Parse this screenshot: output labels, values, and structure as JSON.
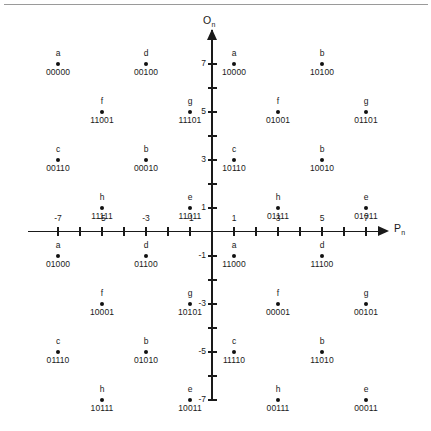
{
  "figure": {
    "x_axis_label": "P",
    "x_axis_sub": "n",
    "y_axis_label": "O",
    "y_axis_sub": "n",
    "point_color": "#111111",
    "axis_color": "#1a1a1a",
    "rule_color": "#9a9a9a"
  },
  "chart_data": {
    "type": "scatter",
    "title": "",
    "xlabel": "Pn",
    "ylabel": "On",
    "xlim": [
      -8.5,
      8.5
    ],
    "ylim": [
      -8.5,
      8.5
    ],
    "grid": false,
    "legend": "none",
    "x_ticks": [
      -7,
      -6,
      -5,
      -4,
      -3,
      -2,
      -1,
      1,
      2,
      3,
      4,
      5,
      6,
      7
    ],
    "x_tick_labels": [
      "-7",
      "",
      "-5",
      "",
      "-3",
      "",
      "-1",
      "1",
      "",
      "3",
      "",
      "5",
      "",
      "7"
    ],
    "y_ticks": [
      7,
      6,
      5,
      4,
      3,
      2,
      1,
      -1,
      -2,
      -3,
      -4,
      -5,
      -6,
      -7
    ],
    "y_tick_labels": [
      "7",
      "",
      "5",
      "",
      "3",
      "",
      "1",
      "-1",
      "",
      "-3",
      "",
      "-5",
      "",
      "-7"
    ],
    "points": [
      {
        "x": -7,
        "y": 7,
        "letter": "a",
        "code": "00000"
      },
      {
        "x": -3,
        "y": 7,
        "letter": "d",
        "code": "00100"
      },
      {
        "x": 1,
        "y": 7,
        "letter": "a",
        "code": "10000"
      },
      {
        "x": 5,
        "y": 7,
        "letter": "b",
        "code": "10100"
      },
      {
        "x": -5,
        "y": 5,
        "letter": "f",
        "code": "11001"
      },
      {
        "x": -1,
        "y": 5,
        "letter": "g",
        "code": "11101"
      },
      {
        "x": 3,
        "y": 5,
        "letter": "f",
        "code": "01001"
      },
      {
        "x": 7,
        "y": 5,
        "letter": "g",
        "code": "01101"
      },
      {
        "x": -7,
        "y": 3,
        "letter": "c",
        "code": "00110"
      },
      {
        "x": -3,
        "y": 3,
        "letter": "b",
        "code": "00010"
      },
      {
        "x": 1,
        "y": 3,
        "letter": "c",
        "code": "10110"
      },
      {
        "x": 5,
        "y": 3,
        "letter": "b",
        "code": "10010"
      },
      {
        "x": -5,
        "y": 1,
        "letter": "h",
        "code": "11111"
      },
      {
        "x": -1,
        "y": 1,
        "letter": "e",
        "code": "11011"
      },
      {
        "x": 3,
        "y": 1,
        "letter": "h",
        "code": "01111"
      },
      {
        "x": 7,
        "y": 1,
        "letter": "e",
        "code": "01011"
      },
      {
        "x": -7,
        "y": -1,
        "letter": "a",
        "code": "01000"
      },
      {
        "x": -3,
        "y": -1,
        "letter": "d",
        "code": "01100"
      },
      {
        "x": 1,
        "y": -1,
        "letter": "a",
        "code": "11000"
      },
      {
        "x": 5,
        "y": -1,
        "letter": "d",
        "code": "11100"
      },
      {
        "x": -5,
        "y": -3,
        "letter": "f",
        "code": "10001"
      },
      {
        "x": -1,
        "y": -3,
        "letter": "g",
        "code": "10101"
      },
      {
        "x": 3,
        "y": -3,
        "letter": "f",
        "code": "00001"
      },
      {
        "x": 7,
        "y": -3,
        "letter": "g",
        "code": "00101"
      },
      {
        "x": -7,
        "y": -5,
        "letter": "c",
        "code": "01110"
      },
      {
        "x": -3,
        "y": -5,
        "letter": "b",
        "code": "01010"
      },
      {
        "x": 1,
        "y": -5,
        "letter": "c",
        "code": "11110"
      },
      {
        "x": 5,
        "y": -5,
        "letter": "b",
        "code": "11010"
      },
      {
        "x": -5,
        "y": -7,
        "letter": "h",
        "code": "10111"
      },
      {
        "x": -1,
        "y": -7,
        "letter": "e",
        "code": "10011"
      },
      {
        "x": 3,
        "y": -7,
        "letter": "h",
        "code": "00111"
      },
      {
        "x": 7,
        "y": -7,
        "letter": "e",
        "code": "00011"
      }
    ]
  }
}
